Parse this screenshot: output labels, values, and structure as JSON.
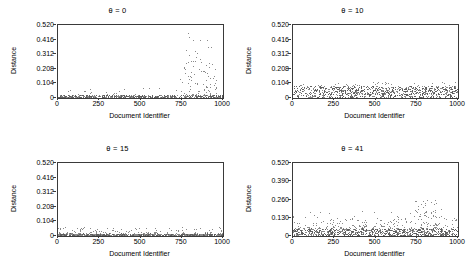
{
  "figure": {
    "width": 470,
    "height": 275,
    "point_color": "#8a8a8a",
    "frame_color": "#3a3a3a"
  },
  "chart_data": [
    {
      "type": "scatter",
      "title": "θ = 0",
      "xlabel": "Document Identifier",
      "ylabel": "Distance",
      "xlim": [
        0,
        1000
      ],
      "ylim": [
        0,
        0.52
      ],
      "xticks": [
        0,
        250,
        500,
        750,
        1000
      ],
      "xtick_labels": [
        "0",
        "250",
        "500",
        "750",
        "1000"
      ],
      "yticks": [
        0,
        0.104,
        0.208,
        0.312,
        0.416,
        0.52
      ],
      "ytick_labels": [
        "0",
        "0.104",
        "0.208",
        "0.312",
        "0.416",
        "0.520"
      ],
      "grid": false,
      "legend": false,
      "description": "Dense baseline band near 0 across all identifiers with sparse outliers rising to 0.52 concentrated between 750 and 950.",
      "baseline_band": [
        0.004,
        0.022
      ],
      "baseline_density": 520,
      "clusters": [
        {
          "x_range": [
            740,
            960
          ],
          "y_range": [
            0.02,
            0.26
          ],
          "count": 85
        },
        {
          "x_range": [
            760,
            950
          ],
          "y_range": [
            0.26,
            0.52
          ],
          "count": 16
        },
        {
          "x_range": [
            0,
            740
          ],
          "y_range": [
            0.02,
            0.09
          ],
          "count": 26
        }
      ]
    },
    {
      "type": "scatter",
      "title": "θ = 10",
      "xlabel": "Document Identifier",
      "ylabel": "Distance",
      "xlim": [
        0,
        1000
      ],
      "ylim": [
        0,
        0.52
      ],
      "xticks": [
        0,
        250,
        500,
        750,
        1000
      ],
      "xtick_labels": [
        "0",
        "250",
        "500",
        "750",
        "1000"
      ],
      "yticks": [
        0,
        0.104,
        0.208,
        0.312,
        0.416,
        0.52
      ],
      "ytick_labels": [
        "0",
        "0.104",
        "0.208",
        "0.312",
        "0.416",
        "0.520"
      ],
      "grid": false,
      "legend": false,
      "description": "Broad uniform dense band from 0 to about 0.09 spanning the full identifier range, with a few points reaching 0.12.",
      "baseline_band": [
        0.002,
        0.085
      ],
      "baseline_density": 900,
      "clusters": [
        {
          "x_range": [
            0,
            1000
          ],
          "y_range": [
            0.085,
            0.115
          ],
          "count": 40
        }
      ]
    },
    {
      "type": "scatter",
      "title": "θ = 15",
      "xlabel": "Document Identifier",
      "ylabel": "Distance",
      "xlim": [
        0,
        1000
      ],
      "ylim": [
        0,
        0.52
      ],
      "xticks": [
        0,
        250,
        500,
        750,
        1000
      ],
      "xtick_labels": [
        "0",
        "250",
        "500",
        "750",
        "1000"
      ],
      "yticks": [
        0,
        0.104,
        0.208,
        0.312,
        0.416,
        0.52
      ],
      "ytick_labels": [
        "0",
        "0.104",
        "0.208",
        "0.312",
        "0.416",
        "0.520"
      ],
      "grid": false,
      "legend": false,
      "description": "Tight dense band just above zero across all identifiers with light scatter up to about 0.06.",
      "baseline_band": [
        0.002,
        0.018
      ],
      "baseline_density": 760,
      "clusters": [
        {
          "x_range": [
            0,
            1000
          ],
          "y_range": [
            0.018,
            0.062
          ],
          "count": 120
        }
      ]
    },
    {
      "type": "scatter",
      "title": "θ = 41",
      "xlabel": "Document Identifier",
      "ylabel": "Distance",
      "xlim": [
        0,
        1000
      ],
      "ylim": [
        0,
        0.52
      ],
      "xticks": [
        0,
        250,
        500,
        750,
        1000
      ],
      "xtick_labels": [
        "0",
        "250",
        "500",
        "750",
        "1000"
      ],
      "yticks": [
        0,
        0.13,
        0.26,
        0.39,
        0.52
      ],
      "ytick_labels": [
        "0",
        "0.130",
        "0.260",
        "0.390",
        "0.520"
      ],
      "grid": false,
      "legend": false,
      "description": "Dense band to about 0.06 across the range with frequent scatter to 0.13 and an elevated cluster between 750 and 900 reaching 0.26.",
      "baseline_band": [
        0.003,
        0.055
      ],
      "baseline_density": 820,
      "clusters": [
        {
          "x_range": [
            0,
            1000
          ],
          "y_range": [
            0.055,
            0.135
          ],
          "count": 190
        },
        {
          "x_range": [
            730,
            910
          ],
          "y_range": [
            0.135,
            0.262
          ],
          "count": 42
        },
        {
          "x_range": [
            0,
            730
          ],
          "y_range": [
            0.135,
            0.185
          ],
          "count": 14
        }
      ]
    }
  ]
}
